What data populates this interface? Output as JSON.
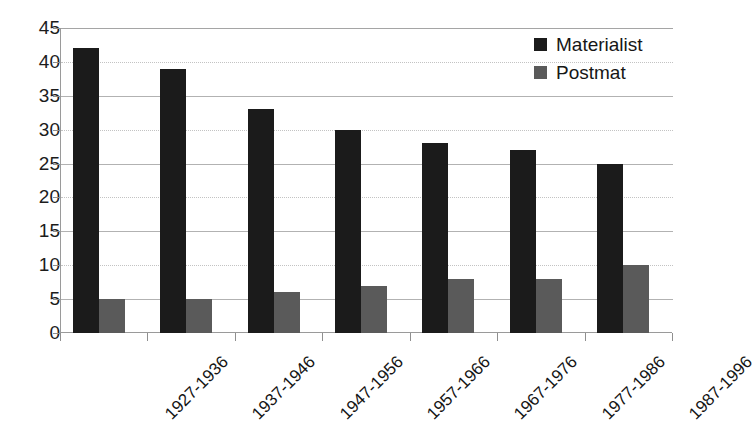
{
  "chart_data": {
    "type": "bar",
    "title": "",
    "subtitle": "",
    "xlabel": "",
    "ylabel": "",
    "categories": [
      "1927-1936",
      "1937-1946",
      "1947-1956",
      "1957-1966",
      "1967-1976",
      "1977-1986",
      "1987-1996"
    ],
    "series": [
      {
        "name": "Materialist",
        "color": "#1b1b1b",
        "values": [
          42,
          39,
          33,
          30,
          28,
          27,
          25
        ]
      },
      {
        "name": "Postmat",
        "color": "#5a5a5a",
        "values": [
          5,
          5,
          6,
          7,
          8,
          8,
          10
        ]
      }
    ],
    "ylim": [
      0,
      45
    ],
    "ytick_step": 5,
    "yticks": [
      45,
      40,
      35,
      30,
      25,
      20,
      15,
      10,
      5,
      0
    ],
    "ytick_labels": [
      "45",
      "40",
      "35",
      "30",
      "25",
      "20",
      "15",
      "10",
      "5",
      "0"
    ],
    "grid": true,
    "grid_axis": "y",
    "legend_position": "top-right",
    "legend_entries": [
      "Materialist",
      "Postmat"
    ]
  }
}
